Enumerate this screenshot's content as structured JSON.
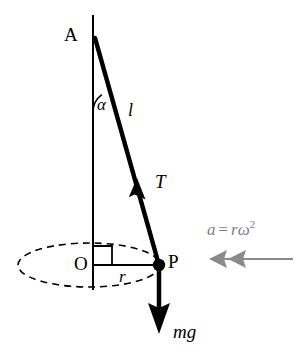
{
  "diagram": {
    "background_color": "#ffffff",
    "stroke_color": "#000000",
    "accel_color": "#808080",
    "labels": {
      "pivot": "A",
      "angle": "α",
      "string_length": "l",
      "tension": "T",
      "center": "O",
      "radius": "r",
      "bob": "P",
      "weight": "mg",
      "accel_symbol": "a",
      "accel_equals": "=",
      "accel_expression": "rω",
      "accel_exponent": "2"
    },
    "geometry": {
      "axis_top": {
        "x": 93,
        "y": 15
      },
      "axis_bottom": {
        "x": 93,
        "y": 290
      },
      "pivot_point": {
        "x": 95,
        "y": 38
      },
      "bob_point": {
        "x": 159,
        "y": 265
      },
      "center_point": {
        "x": 93,
        "y": 265
      },
      "ellipse_center": {
        "x": 89,
        "y": 265
      },
      "ellipse_rx": 71,
      "ellipse_ry": 22,
      "weight_arrow_end": {
        "x": 159,
        "y": 332
      },
      "tension_arrow_tip": {
        "x": 137,
        "y": 180
      },
      "accel_arrow_start": {
        "x": 293,
        "y": 259
      },
      "accel_arrow_end": {
        "x": 211,
        "y": 259
      }
    }
  }
}
